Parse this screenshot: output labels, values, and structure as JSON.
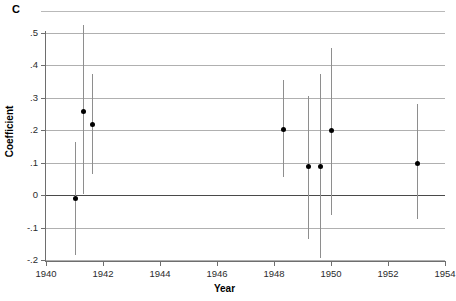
{
  "panel": {
    "letter": "C"
  },
  "chart_data": {
    "type": "scatter",
    "title": "C",
    "xlabel": "Year",
    "ylabel": "Coefficient",
    "xlim": [
      1940,
      1954
    ],
    "ylim": [
      -0.2,
      0.5
    ],
    "grid": true,
    "legend": null,
    "xticks": [
      1940,
      1942,
      1944,
      1946,
      1948,
      1950,
      1952,
      1954
    ],
    "xticklabels": [
      "1940",
      "1942",
      "1944",
      "1946",
      "1948",
      "1950",
      "1952",
      "1954"
    ],
    "yticks": [
      0.5,
      0.4,
      0.3,
      0.2,
      0.1,
      0,
      -0.1,
      -0.2
    ],
    "yticklabels": [
      ".5",
      ".4",
      ".3",
      ".2",
      ".1",
      "0",
      "-.1",
      "-.2"
    ],
    "zero_line": 0,
    "marker_style": "filled-circle",
    "errorbar_style": "vertical-line-no-caps",
    "points": [
      {
        "x": 1941.0,
        "y": -0.01,
        "ylo": -0.185,
        "yhi": 0.165
      },
      {
        "x": 1941.3,
        "y": 0.26,
        "ylo": 0.005,
        "yhi": 0.525
      },
      {
        "x": 1941.6,
        "y": 0.22,
        "ylo": 0.065,
        "yhi": 0.375
      },
      {
        "x": 1948.3,
        "y": 0.205,
        "ylo": 0.055,
        "yhi": 0.355
      },
      {
        "x": 1949.2,
        "y": 0.09,
        "ylo": -0.135,
        "yhi": 0.305
      },
      {
        "x": 1949.6,
        "y": 0.09,
        "ylo": -0.195,
        "yhi": 0.375
      },
      {
        "x": 1950.0,
        "y": 0.2,
        "ylo": -0.06,
        "yhi": 0.455
      },
      {
        "x": 1953.0,
        "y": 0.1,
        "ylo": -0.075,
        "yhi": 0.28
      }
    ]
  }
}
